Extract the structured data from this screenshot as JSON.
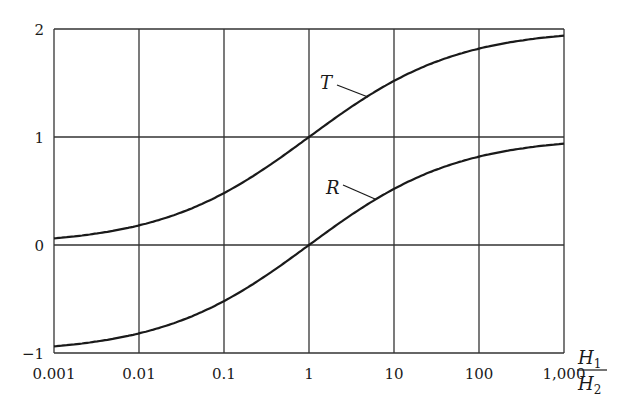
{
  "chart_data": {
    "type": "line",
    "title": "",
    "xlabel": "H1/H2",
    "xlabel_parts": {
      "num_main": "H",
      "num_sub": "1",
      "den_main": "H",
      "den_sub": "2"
    },
    "ylabel": "",
    "xscale": "log",
    "xlim": [
      0.001,
      1000
    ],
    "ylim": [
      -1,
      2
    ],
    "grid": true,
    "legend": "inline labels",
    "x_ticks": [
      0.001,
      0.01,
      0.1,
      1,
      10,
      100,
      1000
    ],
    "x_tick_labels": [
      "0.001",
      "0.01",
      "0.1",
      "1",
      "10",
      "100",
      "1,000"
    ],
    "y_ticks": [
      -1,
      0,
      1,
      2
    ],
    "y_tick_labels": [
      "−1",
      "0",
      "1",
      "2"
    ],
    "x": [
      0.001,
      0.01,
      0.1,
      1,
      10,
      100,
      1000
    ],
    "series": [
      {
        "name": "T",
        "values": [
          0.06,
          0.18,
          0.48,
          1.0,
          1.52,
          1.82,
          1.94
        ]
      },
      {
        "name": "R",
        "values": [
          -0.94,
          -0.82,
          -0.52,
          0.0,
          0.52,
          0.82,
          0.94
        ]
      }
    ],
    "annotations": [
      {
        "text": "T",
        "points_to": "upper curve near x=3"
      },
      {
        "text": "R",
        "points_to": "lower curve near x=3"
      }
    ]
  },
  "colors": {
    "line": "#1a1a1a",
    "grid": "#333333",
    "background": "#ffffff"
  }
}
